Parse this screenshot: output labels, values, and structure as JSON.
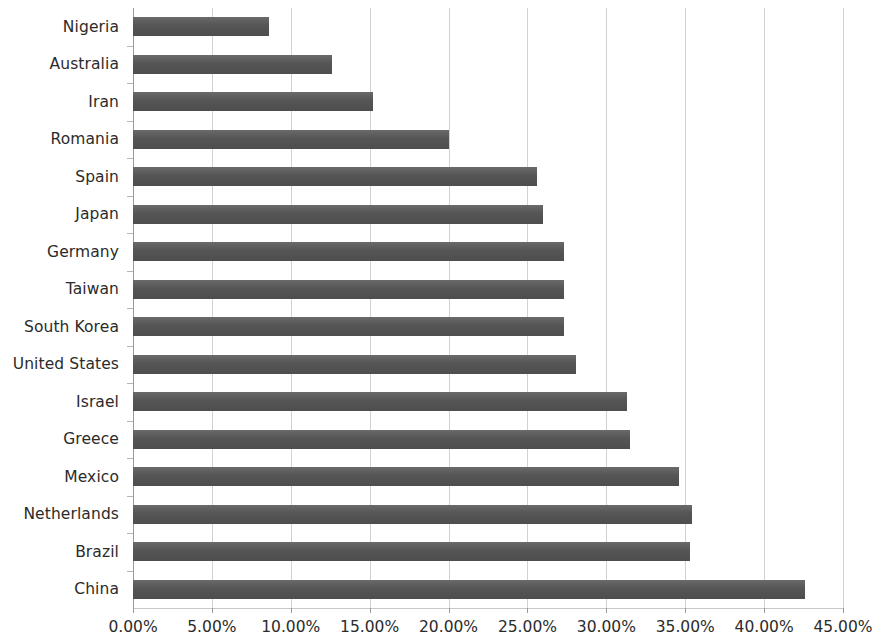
{
  "chart_data": {
    "type": "bar",
    "orientation": "horizontal",
    "title": "",
    "subtitle": "",
    "xlabel": "",
    "ylabel": "",
    "grid": true,
    "legend": false,
    "legend_position": "none",
    "xlim": [
      0,
      45
    ],
    "xtick_labels": [
      "0.00%",
      "5.00%",
      "10.00%",
      "15.00%",
      "20.00%",
      "25.00%",
      "30.00%",
      "35.00%",
      "40.00%",
      "45.00%"
    ],
    "xtick_values": [
      0,
      5,
      10,
      15,
      20,
      25,
      30,
      35,
      40,
      45
    ],
    "value_unit": "%",
    "bar_color": "#5b5b5b",
    "gridline_color": "#d2d2d2",
    "axis_color": "#9a9a9a",
    "text_color": "#2b2b2b",
    "categories": [
      "Nigeria",
      "Australia",
      "Iran",
      "Romania",
      "Spain",
      "Japan",
      "Germany",
      "Taiwan",
      "South Korea",
      "United States",
      "Israel",
      "Greece",
      "Mexico",
      "Netherlands",
      "Brazil",
      "China"
    ],
    "values": [
      8.6,
      12.6,
      15.2,
      20.0,
      25.6,
      26.0,
      27.3,
      27.3,
      27.3,
      28.1,
      31.3,
      31.5,
      34.6,
      35.4,
      35.3,
      42.6
    ],
    "points": [
      {
        "category": "Nigeria",
        "value": 8.6,
        "label": "8.60%"
      },
      {
        "category": "Australia",
        "value": 12.6,
        "label": "12.60%"
      },
      {
        "category": "Iran",
        "value": 15.2,
        "label": "15.20%"
      },
      {
        "category": "Romania",
        "value": 20.0,
        "label": "20.00%"
      },
      {
        "category": "Spain",
        "value": 25.6,
        "label": "25.60%"
      },
      {
        "category": "Japan",
        "value": 26.0,
        "label": "26.00%"
      },
      {
        "category": "Germany",
        "value": 27.3,
        "label": "27.30%"
      },
      {
        "category": "Taiwan",
        "value": 27.3,
        "label": "27.30%"
      },
      {
        "category": "South Korea",
        "value": 27.3,
        "label": "27.30%"
      },
      {
        "category": "United States",
        "value": 28.1,
        "label": "28.10%"
      },
      {
        "category": "Israel",
        "value": 31.3,
        "label": "31.30%"
      },
      {
        "category": "Greece",
        "value": 31.5,
        "label": "31.50%"
      },
      {
        "category": "Mexico",
        "value": 34.6,
        "label": "34.60%"
      },
      {
        "category": "Netherlands",
        "value": 35.4,
        "label": "35.40%"
      },
      {
        "category": "Brazil",
        "value": 35.3,
        "label": "35.30%"
      },
      {
        "category": "China",
        "value": 42.6,
        "label": "42.60%"
      }
    ]
  }
}
